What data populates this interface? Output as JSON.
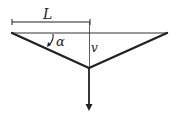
{
  "diagram": {
    "type": "truss-with-load",
    "labels": {
      "length": "L",
      "angle": "α",
      "deflection": "v"
    },
    "colors": {
      "line": "#222222",
      "background": "#ffffff"
    },
    "geometry": {
      "left_support": [
        12,
        33
      ],
      "right_support": [
        167,
        33
      ],
      "apex": [
        89,
        68
      ],
      "load_arrow_end": [
        89,
        110
      ],
      "dimension_line_y": 22
    }
  }
}
